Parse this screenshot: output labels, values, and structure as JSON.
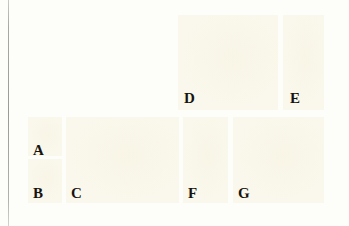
{
  "figure": {
    "kind": "multi-panel-plate-figure",
    "page_background": "#fdfdfa",
    "panel_background": "#faf8ec",
    "label_color": "#17140f",
    "margin_rule_color": "#9a9a9a"
  },
  "panels": [
    {
      "label": "D",
      "x": 178,
      "y": 15,
      "w": 100,
      "h": 95
    },
    {
      "label": "E",
      "x": 283,
      "y": 15,
      "w": 41,
      "h": 95
    },
    {
      "label": "A",
      "x": 28,
      "y": 117,
      "w": 34,
      "h": 39
    },
    {
      "label": "B",
      "x": 28,
      "y": 159,
      "w": 34,
      "h": 44
    },
    {
      "label": "C",
      "x": 66,
      "y": 117,
      "w": 113,
      "h": 86
    },
    {
      "label": "F",
      "x": 183,
      "y": 117,
      "w": 45,
      "h": 86
    },
    {
      "label": "G",
      "x": 233,
      "y": 117,
      "w": 91,
      "h": 86
    }
  ],
  "labels": [
    {
      "text": "D",
      "x": 184,
      "y": 91
    },
    {
      "text": "E",
      "x": 290,
      "y": 91
    },
    {
      "text": "A",
      "x": 33,
      "y": 143
    },
    {
      "text": "B",
      "x": 33,
      "y": 186
    },
    {
      "text": "C",
      "x": 71,
      "y": 186
    },
    {
      "text": "F",
      "x": 188,
      "y": 186
    },
    {
      "text": "G",
      "x": 238,
      "y": 186
    }
  ]
}
